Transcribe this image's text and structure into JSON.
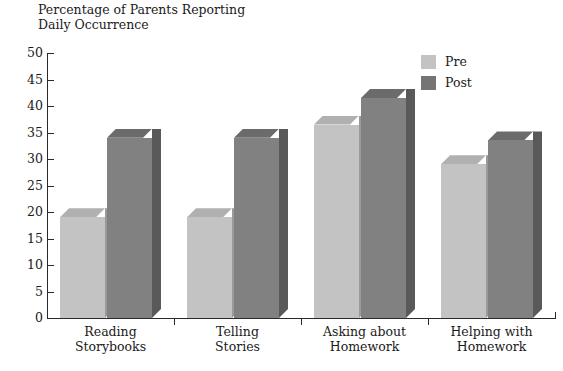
{
  "chart_data": {
    "type": "bar",
    "title": "Percentage of Parents Reporting\nDaily Occurrence",
    "xlabel": "",
    "ylabel": "",
    "ylim": [
      0,
      50
    ],
    "yticks": [
      0,
      5,
      10,
      15,
      20,
      25,
      30,
      35,
      40,
      45,
      50
    ],
    "ytick_labels": [
      "0",
      "5",
      "10",
      "15",
      "20",
      "25",
      "30",
      "35",
      "40",
      "45",
      "50"
    ],
    "grid": false,
    "legend_position": "top-right",
    "style": "3d-bars",
    "categories": [
      "Reading\nStorybooks",
      "Telling\nStories",
      "Asking about\nHomework",
      "Helping with\nHomework"
    ],
    "series": [
      {
        "name": "Pre",
        "color": "#c3c3c3",
        "values": [
          19,
          19,
          36.5,
          29
        ]
      },
      {
        "name": "Post",
        "color": "#818181",
        "values": [
          34,
          34,
          41.5,
          33.5
        ]
      }
    ]
  },
  "legend": {
    "items": [
      {
        "label": "Pre",
        "color": "#c3c3c3"
      },
      {
        "label": "Post",
        "color": "#757575"
      }
    ]
  }
}
